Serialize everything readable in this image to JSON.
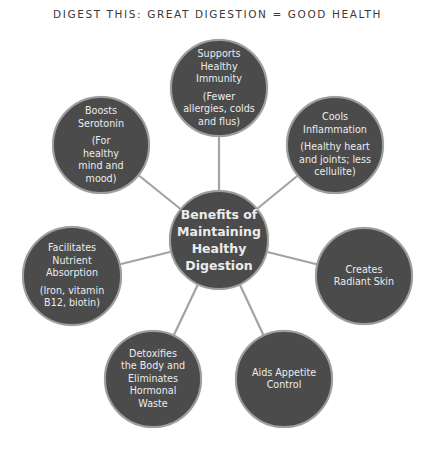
{
  "title": "DIGEST THIS: GREAT DIGESTION = GOOD HEALTH",
  "colors": {
    "node_fill": "#4b4b4b",
    "node_border": "#9d9d9d",
    "connector": "#a3a3a3",
    "text": "#ececec"
  },
  "center": {
    "label": "Benefits of Maintaining Healthy Digestion"
  },
  "nodes": [
    {
      "id": "immunity",
      "main": "Supports Healthy Immunity",
      "sub": "(Fewer allergies, colds and flus)"
    },
    {
      "id": "inflammation",
      "main": "Cools Inflammation",
      "sub": "(Healthy heart and joints; less cellulite)"
    },
    {
      "id": "skin",
      "main": "Creates Radiant Skin",
      "sub": ""
    },
    {
      "id": "appetite",
      "main": "Aids Appetite Control",
      "sub": ""
    },
    {
      "id": "detox",
      "main": "Detoxifies the Body and Eliminates Hormonal Waste",
      "sub": ""
    },
    {
      "id": "absorption",
      "main": "Facilitates Nutrient Absorption",
      "sub": "(Iron, vitamin B12, biotin)"
    },
    {
      "id": "serotonin",
      "main": "Boosts Serotonin",
      "sub": "(For healthy mind and mood)"
    }
  ]
}
